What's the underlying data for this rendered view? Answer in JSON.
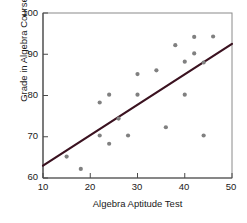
{
  "chart_data": {
    "type": "scatter",
    "title": "",
    "xlabel": "Algebra Aptitude Test",
    "ylabel": "Grade in Algebra Course",
    "xlim": [
      10,
      50
    ],
    "ylim": [
      60,
      100
    ],
    "xticks": [
      10,
      20,
      30,
      40,
      50
    ],
    "yticks": [
      60,
      70,
      80,
      90,
      100
    ],
    "grid": false,
    "legend": null,
    "point_color": "#808080",
    "line_color": "#3b1220",
    "axis_color": "#8a8a8a",
    "points": [
      {
        "x": 15,
        "y": 65.2
      },
      {
        "x": 18,
        "y": 62.2
      },
      {
        "x": 22,
        "y": 78.3
      },
      {
        "x": 22,
        "y": 70.3
      },
      {
        "x": 24,
        "y": 80.2
      },
      {
        "x": 24,
        "y": 68.3
      },
      {
        "x": 26,
        "y": 74.4
      },
      {
        "x": 28,
        "y": 70.3
      },
      {
        "x": 30,
        "y": 85.2
      },
      {
        "x": 30,
        "y": 80.2
      },
      {
        "x": 34,
        "y": 86.1
      },
      {
        "x": 36,
        "y": 72.3
      },
      {
        "x": 38,
        "y": 92.2
      },
      {
        "x": 40,
        "y": 88.2
      },
      {
        "x": 40,
        "y": 80.2
      },
      {
        "x": 42,
        "y": 94.2
      },
      {
        "x": 42,
        "y": 90.2
      },
      {
        "x": 44,
        "y": 88.0
      },
      {
        "x": 44,
        "y": 70.3
      },
      {
        "x": 46,
        "y": 94.3
      }
    ],
    "trendline": {
      "x1": 10,
      "y1": 63.0,
      "x2": 50,
      "y2": 92.5,
      "slope": 0.7375,
      "intercept": 55.625
    }
  },
  "ticklabels": {
    "y": [
      "100",
      "90",
      "80",
      "70",
      "60"
    ],
    "x": [
      "10",
      "20",
      "30",
      "40",
      "50"
    ]
  }
}
